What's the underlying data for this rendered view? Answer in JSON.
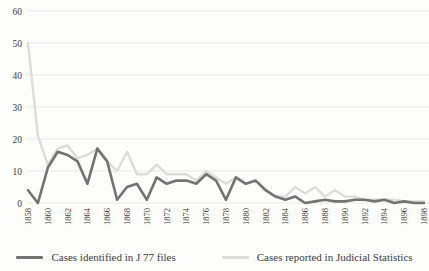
{
  "figure": {
    "background": "#fdfdfb",
    "text_color": "#3b3b3b",
    "grid_color": "#e9e9e5"
  },
  "chart_data": {
    "type": "line",
    "title": "",
    "xlabel": "",
    "ylabel": "",
    "x": [
      1858,
      1859,
      1860,
      1861,
      1862,
      1863,
      1864,
      1865,
      1866,
      1867,
      1868,
      1869,
      1870,
      1871,
      1872,
      1873,
      1874,
      1875,
      1876,
      1877,
      1878,
      1879,
      1880,
      1881,
      1882,
      1883,
      1884,
      1885,
      1886,
      1887,
      1888,
      1889,
      1890,
      1891,
      1892,
      1893,
      1894,
      1895,
      1896,
      1897,
      1898
    ],
    "x_tick_interval": 2,
    "ylim": [
      0,
      60
    ],
    "ytick_step": 10,
    "grid": true,
    "legend_position": "bottom",
    "series": [
      {
        "name": "Cases reported in Judicial Statistics",
        "color": "#dcdcda",
        "stroke_width": 2.4,
        "values": [
          50,
          21,
          12,
          17,
          18,
          14,
          15,
          17,
          13,
          10,
          16,
          9,
          9,
          12,
          9,
          9,
          9,
          7,
          10,
          8,
          6,
          8,
          6,
          7,
          4,
          2,
          2,
          5,
          3,
          5,
          2,
          4,
          2,
          2,
          1,
          1,
          1,
          1,
          0.5,
          0.5,
          0.5
        ]
      },
      {
        "name": "Cases identified in J 77 files",
        "color": "#737373",
        "stroke_width": 2.6,
        "values": [
          4,
          0,
          11,
          16,
          15,
          13,
          6,
          17,
          13,
          1,
          5,
          6,
          1,
          8,
          6,
          7,
          7,
          6,
          9,
          7,
          1,
          8,
          6,
          7,
          4,
          2,
          1,
          2,
          0,
          0.5,
          1,
          0.5,
          0.5,
          1,
          1,
          0.5,
          1,
          0,
          0.5,
          0,
          0
        ]
      }
    ],
    "legend_order": [
      "Cases identified in J 77 files",
      "Cases reported in Judicial Statistics"
    ]
  }
}
